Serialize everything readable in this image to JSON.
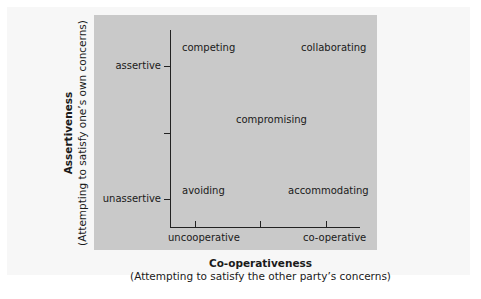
{
  "diagram": {
    "type": "two-axis conflict handling styles grid",
    "quadrant_labels": {
      "top_left": "competing",
      "top_right": "collaborating",
      "center": "compromising",
      "bottom_left": "avoiding",
      "bottom_right": "accommodating"
    },
    "y_axis": {
      "title": "Assertiveness",
      "subtitle": "(Attempting to satisfy one’s own concerns)",
      "tick_labels": {
        "high": "assertive",
        "low": "unassertive"
      }
    },
    "x_axis": {
      "title": "Co-operativeness",
      "subtitle": "(Attempting to satisfy the other party’s concerns)",
      "tick_labels": {
        "low": "uncooperative",
        "high": "co-operative"
      }
    },
    "colors": {
      "panel": "#c9c9c9",
      "sheet": "#f7f7f7",
      "axis": "#222222",
      "text": "#1a1a1a"
    }
  }
}
